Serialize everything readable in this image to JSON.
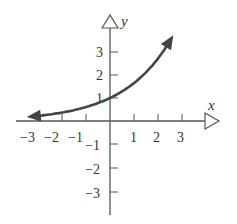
{
  "chart_data": {
    "type": "line",
    "title": "",
    "xlabel": "x",
    "ylabel": "y",
    "xlim": [
      -3.5,
      4
    ],
    "ylim": [
      -4,
      4
    ],
    "grid": false,
    "x_ticks": [
      -3,
      -2,
      -1,
      1,
      2,
      3
    ],
    "y_ticks": [
      -3,
      -2,
      -1,
      1,
      2,
      3
    ],
    "x_tick_labels": [
      "−3",
      "−2",
      "−1",
      "1",
      "2",
      "3"
    ],
    "y_tick_labels": [
      "−3",
      "−2",
      "−1",
      "1",
      "2",
      "3"
    ],
    "series": [
      {
        "name": "exponential curve",
        "x": [
          -3.3,
          -3,
          -2,
          -1,
          0,
          0.5,
          1,
          1.5,
          2,
          2.55
        ],
        "y": [
          0.19,
          0.22,
          0.37,
          0.61,
          1.0,
          1.28,
          1.65,
          2.12,
          2.72,
          3.35
        ],
        "arrow_left": true,
        "arrow_right": true,
        "color": "#444444"
      }
    ]
  },
  "labels": {
    "x_axis": "x",
    "y_axis": "y",
    "xt": [
      "−3",
      "−2",
      "−1",
      "1",
      "2",
      "3"
    ],
    "yt_pos": [
      "1",
      "2",
      "3"
    ],
    "yt_neg": [
      "−1",
      "−2",
      "−3"
    ]
  }
}
